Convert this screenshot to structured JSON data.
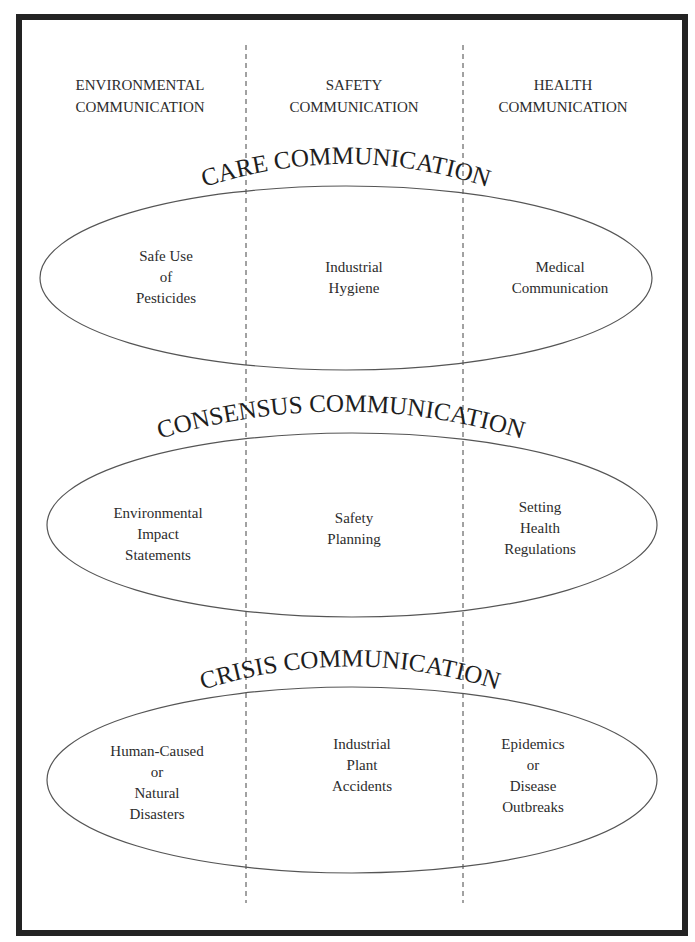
{
  "columns": [
    {
      "line1": "ENVIRONMENTAL",
      "line2": "COMMUNICATION"
    },
    {
      "line1": "SAFETY",
      "line2": "COMMUNICATION"
    },
    {
      "line1": "HEALTH",
      "line2": "COMMUNICATION"
    }
  ],
  "bands": [
    {
      "title": "CARE COMMUNICATION",
      "cells": [
        {
          "lines": [
            "Safe Use",
            "of",
            "Pesticides"
          ]
        },
        {
          "lines": [
            "Industrial",
            "Hygiene"
          ]
        },
        {
          "lines": [
            "Medical",
            "Communication"
          ]
        }
      ]
    },
    {
      "title": "CONSENSUS COMMUNICATION",
      "cells": [
        {
          "lines": [
            "Environmental",
            "Impact",
            "Statements"
          ]
        },
        {
          "lines": [
            "Safety",
            "Planning"
          ]
        },
        {
          "lines": [
            "Setting",
            "Health",
            "Regulations"
          ]
        }
      ]
    },
    {
      "title": "CRISIS COMMUNICATION",
      "cells": [
        {
          "lines": [
            "Human-Caused",
            "or",
            "Natural",
            "Disasters"
          ]
        },
        {
          "lines": [
            "Industrial",
            "Plant",
            "Accidents"
          ]
        },
        {
          "lines": [
            "Epidemics",
            "or",
            "Disease",
            "Outbreaks"
          ]
        }
      ]
    }
  ],
  "colors": {
    "frame": "#232323",
    "ellipse_stroke": "#555555",
    "divider": "#444444",
    "text": "#2c2c2c"
  }
}
